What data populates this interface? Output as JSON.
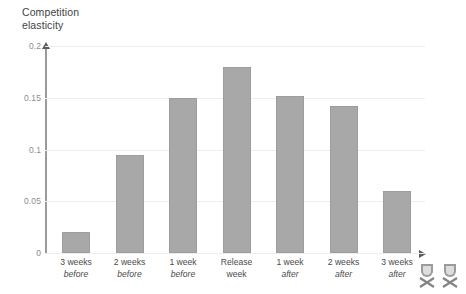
{
  "chart_data": {
    "type": "bar",
    "title": "Competition\nelasticity",
    "title_line1": "Competition",
    "title_line2": "elasticity",
    "xlabel": "",
    "ylabel": "Competition elasticity",
    "ylim": [
      0,
      0.2
    ],
    "grid": true,
    "legend": "none",
    "ytick_labels": [
      "0.2",
      "0.15",
      "0.1",
      "0.05",
      "0"
    ],
    "ytick_values": [
      0.2,
      0.15,
      0.1,
      0.05,
      0
    ],
    "categories": [
      "3 weeks before",
      "2 weeks before",
      "1 week before",
      "Release week",
      "1 week after",
      "2 weeks after",
      "3 weeks after"
    ],
    "category_lines": [
      {
        "line1": "3 weeks",
        "line2": "before",
        "italic_line2": true
      },
      {
        "line1": "2 weeks",
        "line2": "before",
        "italic_line2": true
      },
      {
        "line1": "1 week",
        "line2": "before",
        "italic_line2": true
      },
      {
        "line1": "Release",
        "line2": "week",
        "italic_line2": false
      },
      {
        "line1": "1 week",
        "line2": "after",
        "italic_line2": true
      },
      {
        "line1": "2 weeks",
        "line2": "after",
        "italic_line2": true
      },
      {
        "line1": "3 weeks",
        "line2": "after",
        "italic_line2": true
      }
    ],
    "values": [
      0.02,
      0.095,
      0.15,
      0.18,
      0.152,
      0.142,
      0.06
    ],
    "bar_color": "#a8a8a8",
    "bar_border_color": "#9d9d9d",
    "gridline_color": "#ececf2",
    "axis_color": "#9a9a9a",
    "tick_label_color": "#8d8d8d"
  },
  "watermark": {
    "icon_left": "crest-icon",
    "icon_right": "crest-icon"
  }
}
